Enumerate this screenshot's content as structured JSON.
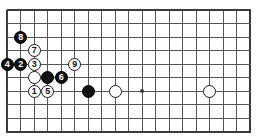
{
  "diagram": {
    "background_color": "#ffffff",
    "line_color": "#55565a",
    "edge_line_color": "#3a3b3f",
    "black_stone_color": "#111111",
    "white_stone_color": "#ffffff",
    "stone_outline_color": "#1a1a1a",
    "board_geometry": {
      "origin_x": 7,
      "origin_y": 10,
      "spacing": 13.5,
      "columns": 19,
      "rows": 10,
      "stone_diameter": 13
    },
    "star_points": [
      {
        "name": "star-point-center-left",
        "col": 10,
        "row": 6
      }
    ],
    "stones": [
      {
        "name": "stone-white-1",
        "color": "white",
        "label": "1",
        "col": 2,
        "row": 6
      },
      {
        "name": "stone-black-2",
        "color": "black",
        "label": "2",
        "col": 1,
        "row": 4
      },
      {
        "name": "stone-white-3",
        "color": "white",
        "label": "3",
        "col": 2,
        "row": 4
      },
      {
        "name": "stone-black-4",
        "color": "black",
        "label": "4",
        "col": 0,
        "row": 4
      },
      {
        "name": "stone-white-5",
        "color": "white",
        "label": "5",
        "col": 3,
        "row": 6
      },
      {
        "name": "stone-black-6",
        "color": "black",
        "label": "6",
        "col": 4,
        "row": 5
      },
      {
        "name": "stone-white-7",
        "color": "white",
        "label": "7",
        "col": 2,
        "row": 3
      },
      {
        "name": "stone-black-8",
        "color": "black",
        "label": "8",
        "col": 1,
        "row": 2
      },
      {
        "name": "stone-white-9",
        "color": "white",
        "label": "9",
        "col": 5,
        "row": 4
      },
      {
        "name": "stone-white-unnumbered-left",
        "color": "white",
        "label": "",
        "col": 2,
        "row": 5
      },
      {
        "name": "stone-black-unnumbered-center",
        "color": "black",
        "label": "",
        "col": 3,
        "row": 5
      },
      {
        "name": "stone-black-unnumbered-right",
        "color": "black",
        "label": "",
        "col": 6,
        "row": 6
      },
      {
        "name": "stone-white-unnumbered-midright",
        "color": "white",
        "label": "",
        "col": 8,
        "row": 6
      },
      {
        "name": "stone-white-unnumbered-farright",
        "color": "white",
        "label": "",
        "col": 15,
        "row": 6
      }
    ]
  }
}
